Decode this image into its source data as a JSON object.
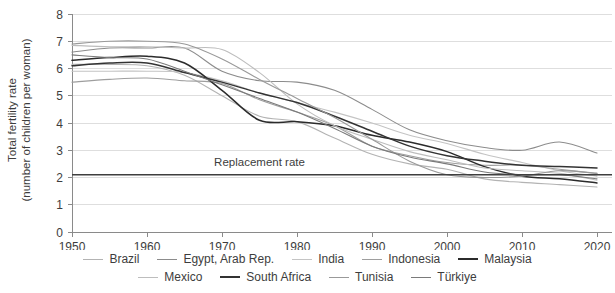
{
  "chart_data": {
    "type": "line",
    "title": "",
    "xlabel": "",
    "ylabel": "Total fertility rate (number of children per woman)",
    "ylabel_line1": "Total fertility rate",
    "ylabel_line2": "(number of children per woman)",
    "xlim": [
      1950,
      2022
    ],
    "ylim": [
      0,
      8
    ],
    "y_ticks": [
      "0",
      "1",
      "2",
      "3",
      "4",
      "5",
      "6",
      "7",
      "8"
    ],
    "x_ticks": [
      "1950",
      "1960",
      "1970",
      "1980",
      "1990",
      "2000",
      "2010",
      "2020"
    ],
    "grid": true,
    "legend_position": "bottom",
    "annotations": [
      {
        "text": "Replacement rate",
        "value": 2.1,
        "x": 1975,
        "type": "horizontal-line-label"
      }
    ],
    "x": [
      1950,
      1955,
      1960,
      1965,
      1970,
      1975,
      1980,
      1985,
      1990,
      1995,
      2000,
      2005,
      2010,
      2015,
      2020
    ],
    "series": [
      {
        "name": "Brazil",
        "color": "#b3b3b3",
        "width": 1.1,
        "values": [
          6.15,
          6.15,
          6.1,
          5.75,
          5.0,
          4.25,
          4.05,
          3.45,
          2.85,
          2.5,
          2.3,
          1.95,
          1.82,
          1.74,
          1.65
        ]
      },
      {
        "name": "Egypt, Arab Rep.",
        "color": "#8c8c8c",
        "width": 1.1,
        "values": [
          6.6,
          6.75,
          6.75,
          6.75,
          5.9,
          5.55,
          5.5,
          5.2,
          4.5,
          3.75,
          3.35,
          3.1,
          3.0,
          3.3,
          2.9
        ]
      },
      {
        "name": "India",
        "color": "#c4c4c4",
        "width": 1.1,
        "values": [
          5.9,
          5.9,
          5.9,
          5.85,
          5.55,
          5.1,
          4.75,
          4.4,
          4.0,
          3.55,
          3.25,
          2.85,
          2.55,
          2.25,
          2.05
        ]
      },
      {
        "name": "Indonesia",
        "color": "#9e9e9e",
        "width": 1.1,
        "values": [
          5.5,
          5.6,
          5.65,
          5.55,
          5.45,
          4.85,
          4.4,
          3.9,
          3.15,
          2.8,
          2.55,
          2.45,
          2.45,
          2.3,
          2.15
        ]
      },
      {
        "name": "Malaysia",
        "color": "#2b2b2b",
        "width": 1.5,
        "values": [
          6.3,
          6.4,
          6.45,
          6.2,
          5.2,
          4.1,
          4.05,
          3.9,
          3.55,
          3.3,
          2.95,
          2.4,
          2.05,
          1.95,
          1.8
        ]
      },
      {
        "name": "Mexico",
        "color": "#bdbdbd",
        "width": 1.1,
        "values": [
          6.85,
          6.8,
          6.8,
          6.75,
          6.7,
          5.85,
          4.7,
          3.9,
          3.4,
          2.95,
          2.65,
          2.35,
          2.25,
          2.15,
          1.9
        ]
      },
      {
        "name": "South Africa",
        "color": "#333333",
        "width": 1.5,
        "values": [
          6.1,
          6.2,
          6.2,
          5.85,
          5.5,
          5.1,
          4.75,
          4.25,
          3.7,
          3.15,
          2.8,
          2.6,
          2.45,
          2.4,
          2.35
        ]
      },
      {
        "name": "Tunisia",
        "color": "#999999",
        "width": 1.1,
        "values": [
          6.9,
          7.0,
          7.0,
          6.9,
          6.35,
          5.6,
          4.9,
          4.2,
          3.4,
          2.6,
          2.1,
          2.0,
          2.05,
          2.25,
          2.15
        ]
      },
      {
        "name": "Türkiye",
        "color": "#7a7a7a",
        "width": 1.1,
        "values": [
          6.5,
          6.4,
          6.35,
          5.9,
          5.4,
          4.9,
          4.4,
          3.8,
          3.15,
          2.75,
          2.5,
          2.2,
          2.1,
          2.1,
          1.95
        ]
      }
    ],
    "legend_rows": [
      [
        "Brazil",
        "Egypt, Arab Rep.",
        "India",
        "Indonesia",
        "Malaysia"
      ],
      [
        "Mexico",
        "South Africa",
        "Tunisia",
        "Türkiye"
      ]
    ]
  }
}
